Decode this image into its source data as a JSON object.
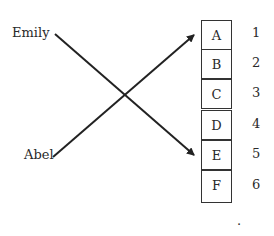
{
  "left_labels": [
    "Emily",
    "Abel"
  ],
  "boxes": [
    "A",
    "B",
    "C",
    "D",
    "E",
    "F"
  ],
  "numbers": [
    "1",
    "2",
    "3",
    "4",
    "5",
    "6"
  ],
  "connections": [
    {
      "from": "Emily",
      "to": "E"
    },
    {
      "from": "Abel",
      "to": "A"
    }
  ],
  "footer": "."
}
